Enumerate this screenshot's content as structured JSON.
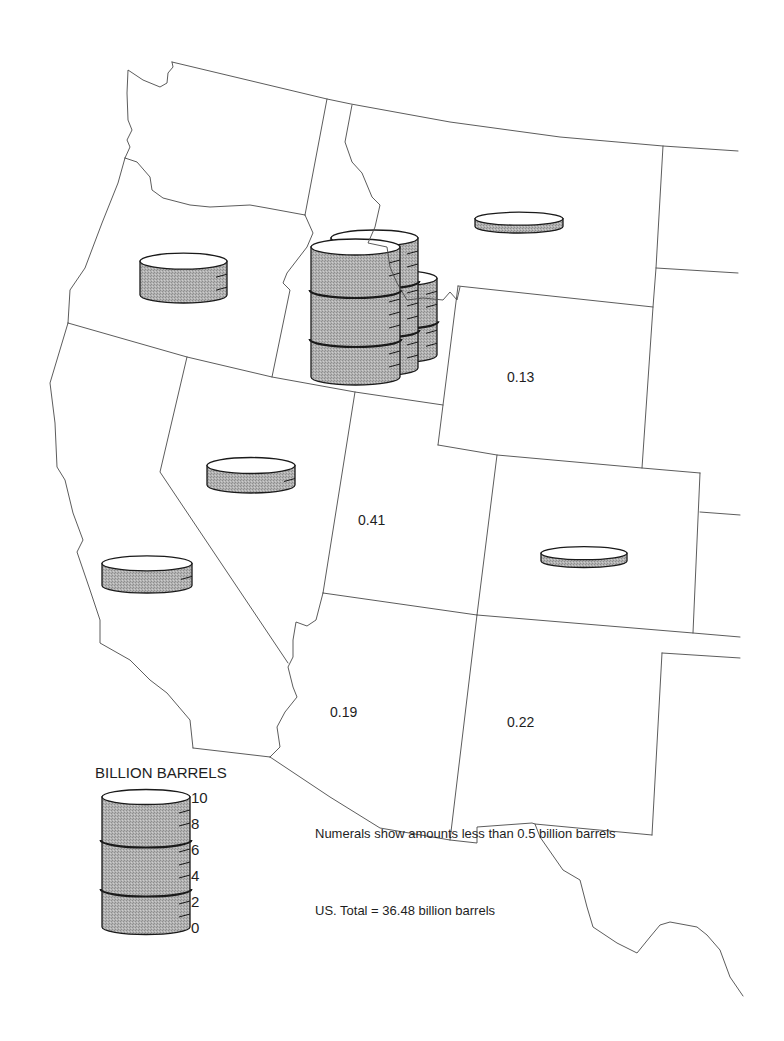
{
  "map": {
    "numerals": [
      {
        "region": "Wyoming",
        "text": "0.13"
      },
      {
        "region": "Utah",
        "text": "0.41"
      },
      {
        "region": "Arizona",
        "text": "0.19"
      },
      {
        "region": "New Mexico",
        "text": "0.22"
      }
    ]
  },
  "legend": {
    "title": "BILLION BARRELS",
    "scale_labels": [
      "10",
      "8",
      "6",
      "4",
      "2",
      "0"
    ]
  },
  "notes": {
    "numerals_note": "Numerals show amounts less than 0.5 billion barrels",
    "total": "US. Total = 36.48 billion barrels"
  },
  "colors": {
    "background": "#ffffff",
    "barrel_fill": "#b2b2b2",
    "barrel_stipple_dark": "#8e8e8e",
    "barrel_stipple_light": "#cdcdcd",
    "barrel_top": "#ffffff",
    "barrel_outline": "#1a1a1a",
    "border": "#4a4a4a"
  },
  "chart_data": {
    "type": "bar",
    "style": "proportional-symbol map with barrel pictograms",
    "title": "BILLION BARRELS",
    "unit": "billion barrels",
    "legend_scale": {
      "min": 0,
      "max": 10,
      "ticks": [
        0,
        2,
        4,
        6,
        8,
        10
      ]
    },
    "px_per_unit": 13,
    "categories": [
      "Idaho",
      "Oregon",
      "California",
      "Nevada",
      "Montana",
      "Colorado",
      "Utah",
      "New Mexico",
      "Arizona",
      "Wyoming"
    ],
    "values": [
      25.9,
      2.6,
      1.7,
      1.5,
      0.6,
      0.6,
      0.41,
      0.22,
      0.19,
      0.13
    ],
    "encoding": {
      "barrel": "amounts >= 0.5",
      "numeral": "amounts < 0.5"
    },
    "annotations": [
      "Numerals show amounts less than 0.5 billion barrels",
      "US. Total = 36.48 billion barrels"
    ],
    "total": 36.48,
    "symbols": [
      {
        "name": "barrel-oregon",
        "region": "Oregon",
        "value": 2.6,
        "cx": 183.5,
        "base": 295,
        "rx": 43.5,
        "ry": 8
      },
      {
        "name": "barrel-montana",
        "region": "Montana",
        "value": 0.6,
        "cx": 519,
        "base": 226.5,
        "rx": 44,
        "ry": 6.5
      },
      {
        "name": "barrel-idaho-back",
        "region": "Idaho",
        "value": 5.9,
        "cx": 393,
        "base": 355,
        "rx": 44,
        "ry": 8
      },
      {
        "name": "barrel-idaho-middle",
        "region": "Idaho",
        "value": 10,
        "cx": 374.5,
        "base": 368,
        "rx": 43.5,
        "ry": 8
      },
      {
        "name": "barrel-idaho-front",
        "region": "Idaho",
        "value": 10,
        "cx": 355.5,
        "base": 377,
        "rx": 44.5,
        "ry": 8
      },
      {
        "name": "barrel-nevada",
        "region": "Nevada",
        "value": 1.5,
        "cx": 251,
        "base": 485,
        "rx": 44,
        "ry": 8
      },
      {
        "name": "barrel-california",
        "region": "California",
        "value": 1.7,
        "cx": 147,
        "base": 585.5,
        "rx": 45,
        "ry": 7.5
      },
      {
        "name": "barrel-colorado",
        "region": "Colorado",
        "value": 0.6,
        "cx": 584,
        "base": 561,
        "rx": 43,
        "ry": 6.5
      },
      {
        "name": "legend-barrel",
        "region": "legend",
        "value": 10,
        "cx": 146,
        "base": 927,
        "rx": 44,
        "ry": 7.5
      }
    ]
  }
}
